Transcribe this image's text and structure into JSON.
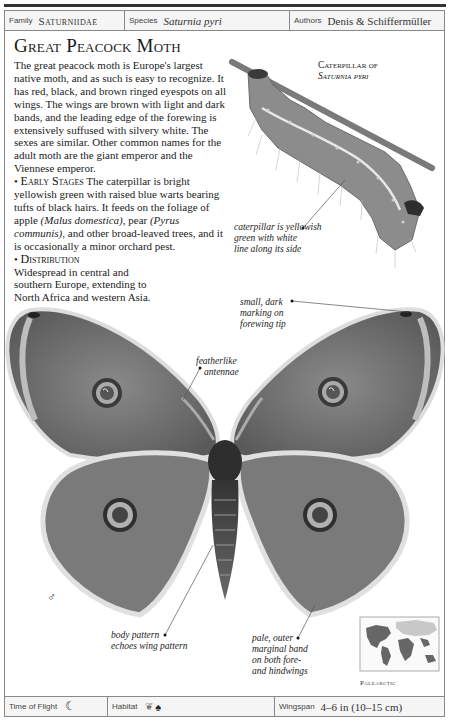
{
  "header": {
    "family_label": "Family",
    "family_value": "Saturniidae",
    "species_label": "Species",
    "species_value": "Saturnia pyri",
    "authors_label": "Authors",
    "authors_value": "Denis & Schiffermüller"
  },
  "title": "Great Peacock Moth",
  "description": {
    "intro": "The great peacock moth is Europe's largest native moth, and as such is easy to recognize. It has red, black, and brown ringed eyespots on all wings. The wings are brown with light and dark bands, and the leading edge of the forewing is extensively suffused with silvery white. The sexes are similar. Other common names for the adult moth are the giant emperor and the Viennese emperor.",
    "early_stages_heading": "Early Stages",
    "early_stages_text_1": "The caterpillar is bright yellowish green with raised blue warts bearing tufts of black hairs. It feeds on the foliage of apple",
    "early_stages_latin_1": "(Malus domestica)",
    "early_stages_text_2": ", pear",
    "early_stages_latin_2": "(Pyrus communis)",
    "early_stages_text_3": ", and other broad-leaved trees, and it is occasionally a minor orchard pest.",
    "distribution_heading": "Distribution",
    "distribution_text": "Widespread in central and southern Europe, extending to North Africa and western Asia."
  },
  "caterpillar": {
    "title_line1": "Caterpillar of",
    "title_line2": "Saturnia pyri",
    "caption_line1": "caterpillar is yellowish",
    "caption_line2": "green with white",
    "caption_line3": "line along its side"
  },
  "annotations": {
    "forewing_tip": [
      "small, dark",
      "marking on",
      "forewing tip"
    ],
    "antennae": [
      "featherlike",
      "antennae"
    ],
    "body_pattern": [
      "body pattern",
      "echoes wing pattern"
    ],
    "marginal_band": [
      "pale, outer",
      "marginal band",
      "on both fore-",
      "and hindwings"
    ]
  },
  "sex_symbol": "♂",
  "map": {
    "region_label": "Palearctic"
  },
  "footer": {
    "time_of_flight_label": "Time of Flight",
    "time_of_flight_icon": "moon-icon",
    "habitat_label": "Habitat",
    "habitat_icons": [
      "grass-icon",
      "tree-icon"
    ],
    "wingspan_label": "Wingspan",
    "wingspan_value": "4–6 in (10–15 cm)"
  },
  "colors": {
    "frame": "#888888",
    "header_bg": "#f5f5f5",
    "text": "#222222"
  }
}
